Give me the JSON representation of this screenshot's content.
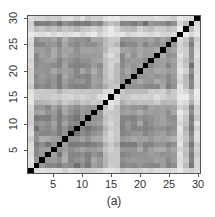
{
  "chart_data": {
    "type": "heatmap",
    "title": "",
    "caption": "(a)",
    "xlabel": "",
    "ylabel": "",
    "n": 30,
    "xlim": [
      1,
      30
    ],
    "ylim": [
      1,
      30
    ],
    "x_ticks": [
      5,
      10,
      15,
      20,
      25,
      30
    ],
    "y_ticks": [
      5,
      10,
      15,
      20,
      25,
      30
    ],
    "colormap": "grayscale (white = low, black = high)",
    "diagonal_value": 1.0,
    "diagonal_color": "#000000",
    "index_strength": [
      0.15,
      0.72,
      0.62,
      0.68,
      0.6,
      0.78,
      0.55,
      0.7,
      0.75,
      0.65,
      0.72,
      0.58,
      0.62,
      0.35,
      0.2,
      0.3,
      0.7,
      0.6,
      0.66,
      0.58,
      0.7,
      0.62,
      0.6,
      0.55,
      0.68,
      0.6,
      0.1,
      0.3,
      0.75,
      0.15
    ]
  },
  "axes": {
    "x_labels": [
      "5",
      "10",
      "15",
      "20",
      "25",
      "30"
    ],
    "y_labels": [
      "5",
      "10",
      "15",
      "20",
      "25",
      "30"
    ]
  },
  "caption": "(a)"
}
